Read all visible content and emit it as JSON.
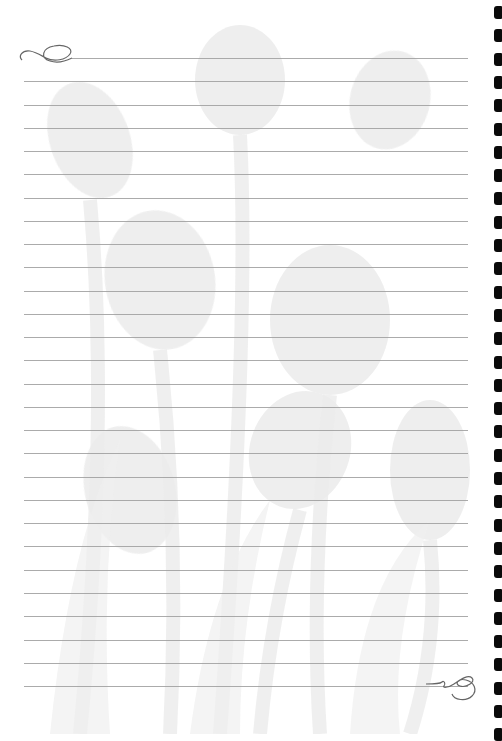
{
  "page": {
    "type": "lined-notepaper",
    "background_color": "#ffffff",
    "rule_color": "#9c9c9c",
    "hole_color": "#0a0a0a",
    "watermark": "faded-tulip-flowers",
    "rule_count": 28,
    "first_rule_y": 58,
    "rule_spacing": 23.26,
    "rule_left": 24,
    "rule_right": 468,
    "hole_count": 32,
    "hole_spacing": 23.3,
    "hole_first_y": 6,
    "decorations": {
      "top_left": "swirl-flourish-icon",
      "bottom_right": "swirl-flourish-icon"
    }
  }
}
